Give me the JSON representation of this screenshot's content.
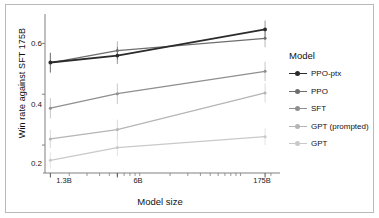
{
  "chart_data": {
    "type": "line",
    "title": "",
    "xlabel": "Model size",
    "ylabel": "Win rate against SFT 175B",
    "legend_title": "Model",
    "legend_position": "right",
    "grid": false,
    "xscale": "log",
    "x": [
      1.3,
      6,
      175
    ],
    "xticklabels": [
      "1.3B",
      "6B",
      "175B"
    ],
    "yticklabels": [
      "0.2",
      "0.4",
      "0.6"
    ],
    "yticks": [
      0.2,
      0.4,
      0.6
    ],
    "ylim": [
      0.09,
      0.7
    ],
    "xlim": [
      1.15,
      205
    ],
    "series": [
      {
        "name": "PPO-ptx",
        "color": "#2b2b2b",
        "values": [
          0.525,
          0.552,
          0.655
        ],
        "err_low": [
          0.487,
          0.519,
          0.62
        ],
        "err_high": [
          0.563,
          0.585,
          0.69
        ]
      },
      {
        "name": "PPO",
        "color": "#6e6e6e",
        "values": [
          0.523,
          0.572,
          0.62
        ],
        "err_low": [
          0.483,
          0.536,
          0.585
        ],
        "err_high": [
          0.563,
          0.608,
          0.655
        ]
      },
      {
        "name": "SFT",
        "color": "#8f8f8f",
        "values": [
          0.345,
          0.402,
          0.49
        ],
        "err_low": [
          0.305,
          0.362,
          0.452
        ],
        "err_high": [
          0.385,
          0.442,
          0.528
        ]
      },
      {
        "name": "GPT (prompted)",
        "color": "#b5b5b5",
        "values": [
          0.224,
          0.261,
          0.405
        ],
        "err_low": [
          0.188,
          0.222,
          0.368
        ],
        "err_high": [
          0.26,
          0.3,
          0.442
        ]
      },
      {
        "name": "GPT",
        "color": "#c9c9c9",
        "values": [
          0.14,
          0.19,
          0.233
        ],
        "err_low": [
          0.108,
          0.156,
          0.2
        ],
        "err_high": [
          0.172,
          0.224,
          0.266
        ]
      }
    ]
  },
  "axis": {
    "ylabel": "Win rate against SFT 175B",
    "xlabel": "Model size",
    "ytick_0": "0.2",
    "ytick_1": "0.4",
    "ytick_2": "0.6",
    "xtick_0": "1.3B",
    "xtick_1": "6B",
    "xtick_2": "175B"
  },
  "legend": {
    "title": "Model",
    "items": [
      {
        "label": "PPO-ptx"
      },
      {
        "label": "PPO"
      },
      {
        "label": "SFT"
      },
      {
        "label": "GPT (prompted)"
      },
      {
        "label": "GPT"
      }
    ]
  }
}
